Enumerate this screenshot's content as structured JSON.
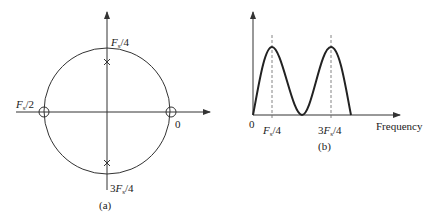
{
  "figure_a": {
    "caption": "(a)",
    "label_top": "Fs/4",
    "label_top_parts": {
      "pre": "",
      "main": "F",
      "sub": "s",
      "post": "/4"
    },
    "label_left_parts": {
      "pre": "",
      "main": "F",
      "sub": "s",
      "post": "/2"
    },
    "label_right": "0",
    "label_bottom_parts": {
      "pre": "3",
      "main": "F",
      "sub": "s",
      "post": "/4"
    },
    "poles": [
      "upper imaginary axis",
      "lower imaginary axis"
    ],
    "zeros": [
      "z = -1",
      "z = 1"
    ]
  },
  "figure_b": {
    "caption": "(b)",
    "origin_label": "0",
    "x_axis_label": "Frequency",
    "tick1_parts": {
      "pre": "",
      "main": "F",
      "sub": "s",
      "post": "/4"
    },
    "tick2_parts": {
      "pre": "3",
      "main": "F",
      "sub": "s",
      "post": "/4"
    }
  },
  "colors": {
    "stroke": "#333333",
    "dashed": "#666666"
  }
}
